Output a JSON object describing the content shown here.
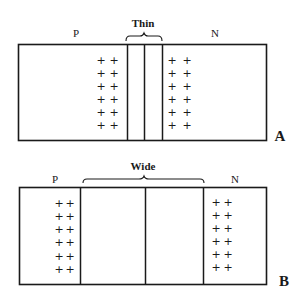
{
  "diagram": {
    "type": "pn-junction-depletion-region",
    "colors": {
      "ink": "#1a1a1a",
      "background": "#ffffff"
    },
    "panels": [
      {
        "id": "A",
        "panel_label": "A",
        "left_region_label": "P",
        "right_region_label": "N",
        "depletion_label": "Thin",
        "charge_symbol": "+",
        "left_charges": {
          "columns": 2,
          "rows": 6
        },
        "right_charges": {
          "columns": 2,
          "rows": 6
        }
      },
      {
        "id": "B",
        "panel_label": "B",
        "left_region_label": "P",
        "right_region_label": "N",
        "depletion_label": "Wide",
        "charge_symbol": "+",
        "left_charges": {
          "columns": 2,
          "rows": 6
        },
        "right_charges": {
          "columns": 2,
          "rows": 6
        }
      }
    ]
  }
}
